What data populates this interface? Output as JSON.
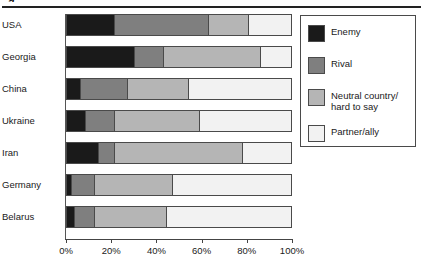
{
  "figure": {
    "caption_fragment": "g",
    "has_top_rule": true
  },
  "legend": {
    "position": "right",
    "items": [
      {
        "label": "Enemy",
        "color": "#1a1a1a"
      },
      {
        "label": "Rival",
        "color": "#7f7f7f"
      },
      {
        "label": "Neutral country/\nhard to say",
        "color": "#b5b5b5"
      },
      {
        "label": "Partner/ally",
        "color": "#f2f2f2"
      }
    ]
  },
  "axis": {
    "ticks": [
      "0%",
      "20%",
      "40%",
      "60%",
      "80%",
      "100%"
    ],
    "tick_values": [
      0,
      20,
      40,
      60,
      80,
      100
    ],
    "min": 0,
    "max": 100
  },
  "chart_data": {
    "type": "bar",
    "orientation": "horizontal",
    "stacked": true,
    "normalized": "100%",
    "title": "",
    "xlabel": "",
    "ylabel": "",
    "xlim": [
      0,
      100
    ],
    "grid": false,
    "legend_position": "right",
    "categories": [
      "USA",
      "Georgia",
      "China",
      "Ukraine",
      "Iran",
      "Germany",
      "Belarus"
    ],
    "series": [
      {
        "name": "Enemy",
        "color": "#1a1a1a",
        "values": [
          21,
          30,
          6,
          8,
          14,
          2,
          3
        ]
      },
      {
        "name": "Rival",
        "color": "#7f7f7f",
        "values": [
          42,
          13,
          21,
          13,
          7,
          10,
          9
        ]
      },
      {
        "name": "Neutral country/hard to say",
        "color": "#b5b5b5",
        "values": [
          18,
          43,
          27,
          38,
          57,
          35,
          32
        ]
      },
      {
        "name": "Partner/ally",
        "color": "#f2f2f2",
        "values": [
          19,
          14,
          46,
          41,
          22,
          53,
          56
        ]
      }
    ],
    "rows": [
      {
        "category": "USA",
        "Enemy": 21,
        "Rival": 42,
        "Neutral country/hard to say": 18,
        "Partner/ally": 19
      },
      {
        "category": "Georgia",
        "Enemy": 30,
        "Rival": 13,
        "Neutral country/hard to say": 43,
        "Partner/ally": 14
      },
      {
        "category": "China",
        "Enemy": 6,
        "Rival": 21,
        "Neutral country/hard to say": 27,
        "Partner/ally": 46
      },
      {
        "category": "Ukraine",
        "Enemy": 8,
        "Rival": 13,
        "Neutral country/hard to say": 38,
        "Partner/ally": 41
      },
      {
        "category": "Iran",
        "Enemy": 14,
        "Rival": 7,
        "Neutral country/hard to say": 57,
        "Partner/ally": 22
      },
      {
        "category": "Germany",
        "Enemy": 2,
        "Rival": 10,
        "Neutral country/hard to say": 35,
        "Partner/ally": 53
      },
      {
        "category": "Belarus",
        "Enemy": 3,
        "Rival": 9,
        "Neutral country/hard to say": 32,
        "Partner/ally": 56
      }
    ]
  }
}
